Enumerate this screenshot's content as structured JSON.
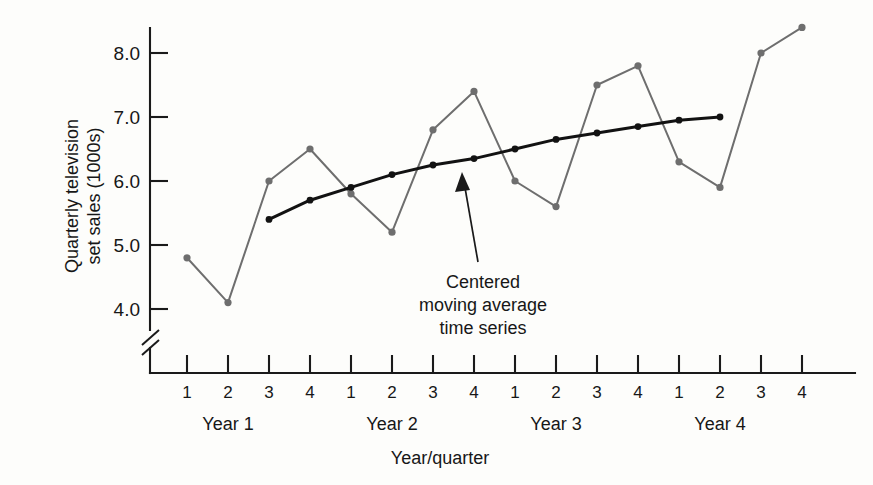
{
  "chart_data": {
    "type": "line",
    "title": "",
    "xlabel": "Year/quarter",
    "ylabel_line1": "Quarterly television",
    "ylabel_line2": "set sales (1000s)",
    "ylim": [
      3.6,
      8.6
    ],
    "ytick_labels": [
      "4.0",
      "5.0",
      "6.0",
      "7.0",
      "8.0"
    ],
    "ytick_values": [
      4.0,
      5.0,
      6.0,
      7.0,
      8.0
    ],
    "axis_break": true,
    "grid": false,
    "legend": "none",
    "x_tick_labels": [
      "1",
      "2",
      "3",
      "4",
      "1",
      "2",
      "3",
      "4",
      "1",
      "2",
      "3",
      "4",
      "1",
      "2",
      "3",
      "4"
    ],
    "group_labels": [
      "Year 1",
      "Year 2",
      "Year 3",
      "Year 4"
    ],
    "series": [
      {
        "name": "Quarterly television set sales",
        "color": "#6e6e6e",
        "x": [
          1,
          2,
          3,
          4,
          5,
          6,
          7,
          8,
          9,
          10,
          11,
          12,
          13,
          14,
          15,
          16
        ],
        "values": [
          4.8,
          4.1,
          6.0,
          6.5,
          5.8,
          5.2,
          6.8,
          7.4,
          6.0,
          5.6,
          7.5,
          7.8,
          6.3,
          5.9,
          8.0,
          8.4
        ]
      },
      {
        "name": "Centered moving average time series",
        "color": "#121212",
        "x": [
          3,
          4,
          5,
          6,
          7,
          8,
          9,
          10,
          11,
          12,
          13,
          14
        ],
        "values": [
          5.4,
          5.7,
          5.9,
          6.1,
          6.25,
          6.35,
          6.5,
          6.65,
          6.75,
          6.85,
          6.95,
          7.0
        ]
      }
    ],
    "annotations": [
      {
        "name": "centered-moving-average-callout",
        "lines": [
          "Centered",
          "moving average",
          "time series"
        ],
        "points_to_series": "Centered moving average time series"
      }
    ],
    "colors": {
      "observed_series": "#6e6e6e",
      "cma_series": "#121212",
      "axis": "#1a1a1a",
      "background": "#fdfdfb"
    }
  }
}
